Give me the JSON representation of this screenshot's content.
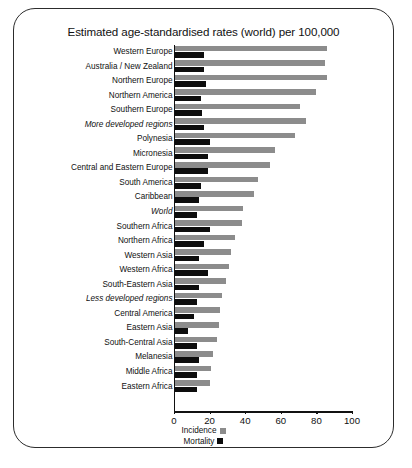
{
  "chart_data": {
    "type": "bar",
    "orientation": "horizontal",
    "title": "Estimated age-standardised rates (world) per 100,000",
    "xlabel": "",
    "ylabel": "",
    "xlim": [
      0,
      100
    ],
    "xticks": [
      0,
      20,
      40,
      60,
      80,
      100
    ],
    "grid": false,
    "legend_position": "bottom-center",
    "categories": [
      "Western Europe",
      "Australia / New Zealand",
      "Northern Europe",
      "Northern America",
      "Southern Europe",
      "More developed regions",
      "Polynesia",
      "Micronesia",
      "Central and Eastern Europe",
      "South America",
      "Caribbean",
      "World",
      "Southern Africa",
      "Northern Africa",
      "Western Asia",
      "Western Africa",
      "South-Eastern Asia",
      "Less developed regions",
      "Central America",
      "Eastern Asia",
      "South-Central Asia",
      "Melanesia",
      "Middle Africa",
      "Eastern Africa"
    ],
    "emphasised_categories": [
      "More developed regions",
      "World",
      "Less developed regions"
    ],
    "series": [
      {
        "name": "Incidence",
        "color": "#8c8c8c",
        "values": [
          86,
          85,
          86,
          80,
          71,
          74,
          68,
          57,
          54,
          47,
          45,
          39,
          38,
          34,
          32,
          31,
          29,
          27,
          26,
          25,
          24,
          22,
          21,
          20
        ]
      },
      {
        "name": "Mortality",
        "color": "#0d0d0d",
        "values": [
          17,
          17,
          18,
          15,
          16,
          17,
          20,
          19,
          19,
          15,
          14,
          13,
          20,
          17,
          14,
          19,
          14,
          13,
          11,
          8,
          13,
          14,
          13,
          13
        ]
      }
    ]
  },
  "legend": {
    "items": [
      {
        "label": "Incidence",
        "swatch": "incidence"
      },
      {
        "label": "Mortality",
        "swatch": "mortality"
      }
    ]
  },
  "footer": {
    "text": ""
  }
}
